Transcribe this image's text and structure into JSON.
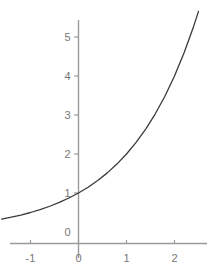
{
  "chart_data": {
    "type": "line",
    "title": "",
    "subtitle": "",
    "xlabel": "",
    "ylabel": "",
    "function": "y = 2^x",
    "xlim": [
      -1.6,
      2.7
    ],
    "ylim": [
      -0.35,
      5.7
    ],
    "xticks": [
      -1,
      0,
      1,
      2
    ],
    "yticks": [
      0,
      1,
      2,
      3,
      4,
      5
    ],
    "xticklabels": [
      "-1",
      "0",
      "1",
      "2"
    ],
    "yticklabels": [
      "0",
      "1",
      "2",
      "3",
      "4",
      "5"
    ],
    "grid": false,
    "legend": false,
    "legend_position": "none",
    "series": [
      {
        "name": "y = 2^x",
        "color": "#3a3a3a",
        "linewidth": 1.3,
        "x": [
          -1.6,
          -1.4,
          -1.2,
          -1.0,
          -0.8,
          -0.6,
          -0.4,
          -0.2,
          0.0,
          0.2,
          0.4,
          0.6,
          0.8,
          1.0,
          1.2,
          1.4,
          1.6,
          1.8,
          2.0,
          2.2,
          2.4,
          2.5
        ],
        "values": [
          0.33,
          0.379,
          0.435,
          0.5,
          0.574,
          0.66,
          0.758,
          0.871,
          1.0,
          1.149,
          1.32,
          1.516,
          1.741,
          2.0,
          2.297,
          2.639,
          3.031,
          3.482,
          4.0,
          4.595,
          5.278,
          5.657
        ]
      }
    ],
    "axis_color": "#9a9a9a",
    "tick_color": "#9a9a9a",
    "label_color": "#777777",
    "background": "#ffffff"
  },
  "axes": {
    "x_axis_name": "x-axis",
    "y_axis_name": "y-axis"
  }
}
